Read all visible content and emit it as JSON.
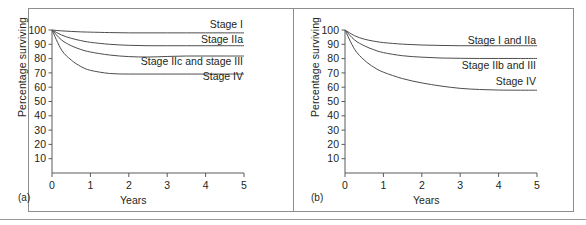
{
  "figure": {
    "panels": [
      {
        "tag": "(a)",
        "xlabel": "Years",
        "ylabel": "Percentage surviving",
        "yticks": [
          "10",
          "20",
          "30",
          "40",
          "50",
          "60",
          "70",
          "80",
          "90",
          "100"
        ],
        "xticks": [
          "0",
          "1",
          "2",
          "3",
          "4",
          "5"
        ],
        "series_labels": [
          "Stage I",
          "Stage IIa",
          "Stage IIc and stage III",
          "Stage IV"
        ]
      },
      {
        "tag": "(b)",
        "xlabel": "Years",
        "ylabel": "Percentage surviving",
        "yticks": [
          "10",
          "20",
          "30",
          "40",
          "50",
          "60",
          "70",
          "80",
          "90",
          "100"
        ],
        "xticks": [
          "0",
          "1",
          "2",
          "3",
          "4",
          "5"
        ],
        "series_labels": [
          "Stage I and IIa",
          "Stage IIb and III",
          "Stage IV"
        ]
      }
    ]
  },
  "chart_data": [
    {
      "type": "line",
      "title": "",
      "subtitle": "",
      "panel": "(a)",
      "xlabel": "Years",
      "ylabel": "Percentage surviving",
      "xlim": [
        0,
        5
      ],
      "ylim": [
        0,
        100
      ],
      "xticks": [
        0,
        1,
        2,
        3,
        4,
        5
      ],
      "yticks": [
        10,
        20,
        30,
        40,
        50,
        60,
        70,
        80,
        90,
        100
      ],
      "grid": false,
      "legend_position": "inline-right",
      "x": [
        0,
        0.25,
        0.5,
        0.75,
        1.0,
        1.5,
        2.0,
        2.5,
        3.0,
        3.5,
        4.0,
        4.5,
        5.0
      ],
      "series": [
        {
          "name": "Stage I",
          "values": [
            100,
            99.4,
            99.0,
            98.7,
            98.5,
            98.2,
            98.0,
            98.0,
            98.0,
            98.0,
            98.0,
            98.0,
            98.0
          ]
        },
        {
          "name": "Stage IIa",
          "values": [
            100,
            96.5,
            94.2,
            92.6,
            91.4,
            90.0,
            89.3,
            89.0,
            89.0,
            89.0,
            89.0,
            89.0,
            89.0
          ]
        },
        {
          "name": "Stage IIc and stage III",
          "values": [
            100,
            93.0,
            89.0,
            86.4,
            84.6,
            82.5,
            81.4,
            81.1,
            81.5,
            81.8,
            81.8,
            81.8,
            81.8
          ]
        },
        {
          "name": "Stage IV",
          "values": [
            100,
            86.0,
            79.0,
            74.5,
            71.8,
            69.6,
            69.2,
            69.2,
            69.2,
            69.2,
            69.2,
            69.2,
            69.2
          ]
        }
      ]
    },
    {
      "type": "line",
      "title": "",
      "subtitle": "",
      "panel": "(b)",
      "xlabel": "Years",
      "ylabel": "Percentage surviving",
      "xlim": [
        0,
        5
      ],
      "ylim": [
        0,
        100
      ],
      "xticks": [
        0,
        1,
        2,
        3,
        4,
        5
      ],
      "yticks": [
        10,
        20,
        30,
        40,
        50,
        60,
        70,
        80,
        90,
        100
      ],
      "grid": false,
      "legend_position": "inline-right",
      "x": [
        0,
        0.25,
        0.5,
        0.75,
        1.0,
        1.5,
        2.0,
        2.5,
        3.0,
        3.5,
        4.0,
        4.5,
        5.0
      ],
      "series": [
        {
          "name": "Stage I and IIa",
          "values": [
            100,
            96.0,
            93.6,
            92.2,
            91.2,
            90.1,
            89.5,
            89.2,
            89.0,
            89.0,
            89.0,
            89.0,
            89.0
          ]
        },
        {
          "name": "Stage IIb and III",
          "values": [
            100,
            93.0,
            89.0,
            86.2,
            84.2,
            82.0,
            81.0,
            80.4,
            80.2,
            80.1,
            80.1,
            80.1,
            80.1
          ]
        },
        {
          "name": "Stage IV",
          "values": [
            100,
            86.5,
            79.0,
            74.0,
            70.5,
            66.0,
            63.0,
            60.8,
            59.2,
            58.4,
            58.0,
            57.9,
            57.9
          ]
        }
      ]
    }
  ]
}
